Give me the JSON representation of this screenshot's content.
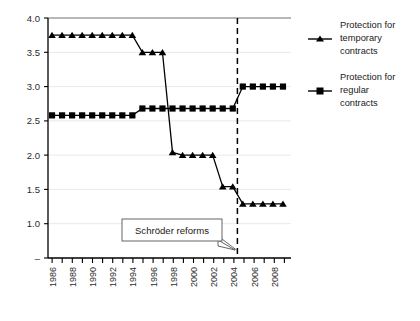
{
  "chart_data": {
    "type": "line",
    "title": "",
    "subtitle": "",
    "xlabel": "",
    "ylabel": "",
    "x": [
      1985,
      1986,
      1987,
      1988,
      1989,
      1990,
      1991,
      1992,
      1993,
      1994,
      1995,
      1996,
      1997,
      1998,
      1999,
      2000,
      2001,
      2002,
      2003,
      2004,
      2005,
      2006,
      2007,
      2008
    ],
    "xlim": [
      1984.6,
      2008.8
    ],
    "ylim": [
      0.5,
      4.0
    ],
    "yticks": [
      1.0,
      1.5,
      2.0,
      2.5,
      3.0,
      3.5,
      4.0
    ],
    "ytick_labels": [
      "–",
      "1.0",
      "1.5",
      "2.0",
      "2.5",
      "3.0",
      "3.5",
      "4.0"
    ],
    "xticks": [
      1985,
      1986,
      1987,
      1988,
      1989,
      1990,
      1991,
      1992,
      1993,
      1994,
      1995,
      1996,
      1997,
      1998,
      1999,
      2000,
      2001,
      2002,
      2003,
      2004,
      2005,
      2006,
      2007,
      2008
    ],
    "xtick_labels": [
      "1986",
      "1988",
      "1990",
      "1992",
      "1994",
      "1996",
      "1998",
      "2000",
      "2002",
      "2004",
      "2006",
      "2008"
    ],
    "xtick_label_years": [
      1986,
      1988,
      1990,
      1992,
      1994,
      1996,
      1998,
      2000,
      2002,
      2004,
      2006,
      2008
    ],
    "grid": true,
    "grid_axis": "y",
    "legend_position": "right",
    "series": [
      {
        "name": "Protection for temporary contracts",
        "marker": "triangle",
        "color": "#000000",
        "values": [
          3.75,
          3.75,
          3.75,
          3.75,
          3.75,
          3.75,
          3.75,
          3.75,
          3.75,
          3.5,
          3.5,
          3.5,
          2.04,
          2.0,
          2.0,
          2.0,
          2.0,
          1.54,
          1.54,
          1.29,
          1.29,
          1.29,
          1.29,
          1.29
        ]
      },
      {
        "name": "Protection for regular contracts",
        "marker": "square",
        "color": "#000000",
        "values": [
          2.58,
          2.58,
          2.58,
          2.58,
          2.58,
          2.58,
          2.58,
          2.58,
          2.58,
          2.68,
          2.68,
          2.68,
          2.68,
          2.68,
          2.68,
          2.68,
          2.68,
          2.68,
          2.68,
          3.0,
          3.0,
          3.0,
          3.0,
          3.0
        ]
      }
    ],
    "annotations": [
      {
        "text": "Schröder reforms",
        "type": "callout-box",
        "points_to_x": 2004,
        "points_to_y": 1.0
      }
    ],
    "reference_lines": [
      {
        "orientation": "vertical",
        "x": 2004,
        "style": "dashed",
        "color": "#000000"
      }
    ]
  },
  "legend": {
    "items": [
      {
        "label_lines": [
          "Protection for",
          "temporary",
          "contracts"
        ],
        "marker": "triangle"
      },
      {
        "label_lines": [
          "Protection for",
          "regular",
          "contracts"
        ],
        "marker": "square"
      }
    ]
  },
  "axis": {
    "y_tick_0": "–",
    "y_tick_1": "1.0",
    "y_tick_2": "1.5",
    "y_tick_3": "2.0",
    "y_tick_4": "2.5",
    "y_tick_5": "3.0",
    "y_tick_6": "3.5",
    "y_tick_7": "4.0",
    "x_tick_0": "1986",
    "x_tick_1": "1988",
    "x_tick_2": "1990",
    "x_tick_3": "1992",
    "x_tick_4": "1994",
    "x_tick_5": "1996",
    "x_tick_6": "1998",
    "x_tick_7": "2000",
    "x_tick_8": "2002",
    "x_tick_9": "2004",
    "x_tick_10": "2006",
    "x_tick_11": "2008"
  },
  "annotation": {
    "label": "Schröder reforms"
  },
  "legend_labels": {
    "s0l0": "Protection for",
    "s0l1": "temporary",
    "s0l2": "contracts",
    "s1l0": "Protection for",
    "s1l1": "regular",
    "s1l2": "contracts"
  }
}
